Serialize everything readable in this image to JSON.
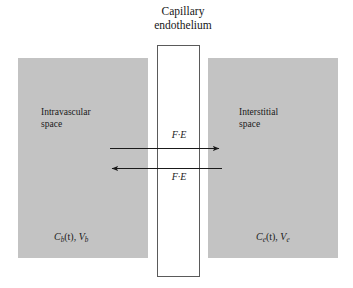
{
  "figure": {
    "title_line1": "Capillary",
    "title_line2": "endothelium",
    "background_color": "#ffffff",
    "compartment_fill": "#c3c3c3",
    "channel_fill": "#ffffff",
    "channel_border_color": "#5a5a5a",
    "line_color": "#1a1a1a"
  },
  "compartments": {
    "left": {
      "name_line1": "Intravascular",
      "name_line2": "space",
      "concentration_symbol": "C",
      "concentration_subscript": "b",
      "concentration_argument": "(t)",
      "separator": ", ",
      "volume_symbol": "V",
      "volume_subscript": "b",
      "variable_label": "Cb(t), Vb"
    },
    "right": {
      "name_line1": "Interstitial",
      "name_line2": "space",
      "concentration_symbol": "C",
      "concentration_subscript": "e",
      "concentration_argument": "(t)",
      "separator": ", ",
      "volume_symbol": "V",
      "volume_subscript": "e",
      "variable_label": "Ce(t), Ve"
    }
  },
  "fluxes": {
    "efflux": {
      "label": "F·E",
      "direction": "right",
      "description": "blood-to-interstitium flux"
    },
    "influx": {
      "label": "F·E",
      "direction": "left",
      "description": "interstitium-to-blood flux"
    }
  }
}
